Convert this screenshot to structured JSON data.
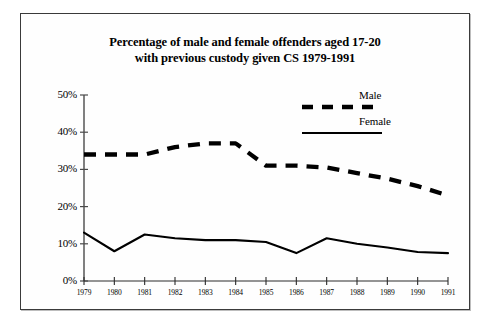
{
  "chart_data": {
    "type": "line",
    "title": "Percentage of male and female offenders aged 17-20 with previous custody  given CS 1979-1991",
    "title_line1": "Percentage of male and female offenders aged 17-20",
    "title_line2": "with previous custody  given CS 1979-1991",
    "xlabel": "",
    "ylabel": "",
    "categories": [
      "1979",
      "1980",
      "1981",
      "1982",
      "1983",
      "1984",
      "1985",
      "1986",
      "1987",
      "1988",
      "1989",
      "1990",
      "1991"
    ],
    "x": [
      1979,
      1980,
      1981,
      1982,
      1983,
      1984,
      1985,
      1986,
      1987,
      1988,
      1989,
      1990,
      1991
    ],
    "ylim": [
      0,
      50
    ],
    "ytick_values": [
      0,
      10,
      20,
      30,
      40,
      50
    ],
    "ytick_labels": [
      "0%",
      "10%",
      "20%",
      "30%",
      "40%",
      "50%"
    ],
    "grid": false,
    "legend_position": "top-right",
    "series": [
      {
        "name": "Male",
        "style": "dashed",
        "color": "#000000",
        "values": [
          34,
          34,
          34,
          36,
          37,
          37,
          31,
          31,
          30.5,
          29,
          27.5,
          25.5,
          23
        ]
      },
      {
        "name": "Female",
        "style": "solid",
        "color": "#000000",
        "values": [
          13,
          8,
          12.5,
          11.5,
          11,
          11,
          10.5,
          7.5,
          11.5,
          10,
          9,
          7.8,
          7.5
        ]
      }
    ]
  },
  "legend": {
    "items": [
      {
        "label": "Male",
        "style": "dashed"
      },
      {
        "label": "Female",
        "style": "solid"
      }
    ]
  },
  "axis": {
    "y_labels": [
      "50%",
      "40%",
      "30%",
      "20%",
      "10%",
      "0%"
    ],
    "x_labels": [
      "1979",
      "1980",
      "1981",
      "1982",
      "1983",
      "1984",
      "1985",
      "1986",
      "1987",
      "1988",
      "1989",
      "1990",
      "1991"
    ]
  }
}
